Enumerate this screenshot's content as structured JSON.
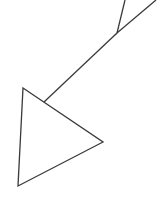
{
  "canvas": {
    "width": 163,
    "height": 201,
    "background": "#ffffff"
  },
  "stroke": {
    "color": "#3a3a3a",
    "width": 1.3
  },
  "shapes": {
    "top_triangle": {
      "points": "125,0 117,33 156,0"
    },
    "connector_line": {
      "x1": 117,
      "y1": 33,
      "x2": 44,
      "y2": 102
    },
    "bottom_triangle": {
      "points": "23,88 103,142 18,186"
    }
  }
}
